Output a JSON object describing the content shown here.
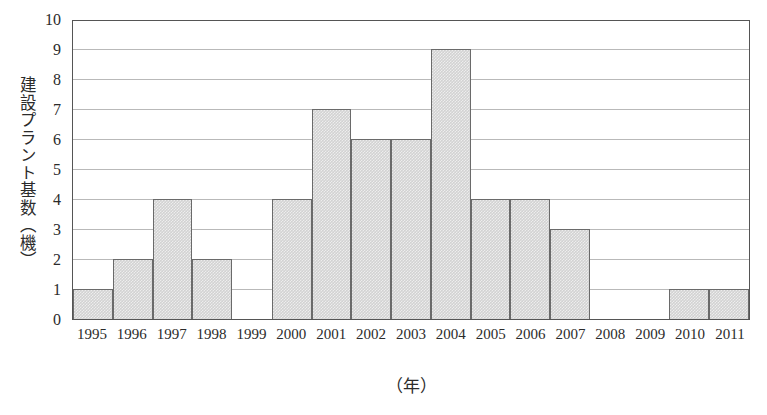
{
  "chart_data": {
    "type": "bar",
    "title": "",
    "xlabel": "（年）",
    "ylabel": "建設プラント基数（機）",
    "categories": [
      "1995",
      "1996",
      "1997",
      "1998",
      "1999",
      "2000",
      "2001",
      "2002",
      "2003",
      "2004",
      "2005",
      "2006",
      "2007",
      "2008",
      "2009",
      "2010",
      "2011"
    ],
    "values": [
      1,
      2,
      4,
      2,
      0,
      4,
      7,
      6,
      6,
      9,
      4,
      4,
      3,
      0,
      0,
      1,
      1
    ],
    "ylim": [
      0,
      10
    ],
    "yticks": [
      "0",
      "1",
      "2",
      "3",
      "4",
      "5",
      "6",
      "7",
      "8",
      "9",
      "10"
    ],
    "grid": true,
    "legend": "none",
    "colors": {
      "bar_fill": "#d2d2d2",
      "bar_border": "#6a6a6a",
      "gridline": "#b9b9b9",
      "frame": "#555555",
      "text": "#2b2b2b"
    }
  }
}
